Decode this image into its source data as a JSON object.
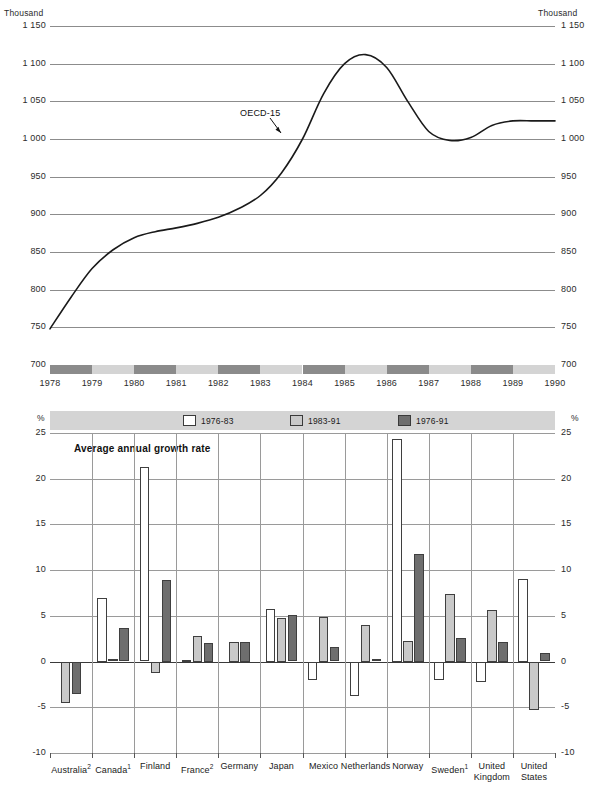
{
  "chart_data": [
    {
      "type": "line",
      "id": "oecd15-index",
      "title": "",
      "unit_label_left": "Thousand",
      "unit_label_right": "Thousand",
      "ylabel": "Thousand",
      "xlabel": "",
      "ylim": [
        700,
        1150
      ],
      "yticks": [
        "700",
        "750",
        "800",
        "850",
        "900",
        "950",
        "1 000",
        "1 050",
        "1 100",
        "1 150"
      ],
      "ytick_values": [
        700,
        750,
        800,
        850,
        900,
        950,
        1000,
        1050,
        1100,
        1150
      ],
      "xticks": [
        "1978",
        "1979",
        "1980",
        "1981",
        "1982",
        "1983",
        "1984",
        "1985",
        "1986",
        "1987",
        "1988",
        "1989",
        "1990"
      ],
      "grid": true,
      "legend": "none",
      "annotations": [
        {
          "text": "OECD-15",
          "x": 1983.3,
          "y": 1035
        }
      ],
      "series": [
        {
          "name": "OECD-15",
          "x": [
            1978,
            1978.5,
            1979,
            1979.5,
            1980,
            1980.5,
            1981,
            1981.5,
            1982,
            1982.5,
            1983,
            1983.5,
            1984,
            1984.5,
            1985,
            1985.5,
            1986,
            1986.5,
            1987,
            1987.5,
            1988,
            1988.5,
            1989,
            1989.5,
            1990
          ],
          "values": [
            748,
            790,
            828,
            853,
            869,
            877,
            882,
            888,
            896,
            908,
            925,
            955,
            1000,
            1060,
            1100,
            1112,
            1095,
            1050,
            1010,
            998,
            1002,
            1018,
            1024,
            1024,
            1024
          ]
        }
      ]
    },
    {
      "type": "bar",
      "id": "average-annual-growth-rate",
      "title": "Average annual growth rate",
      "unit_label_left": "%",
      "unit_label_right": "%",
      "ylabel": "%",
      "xlabel": "",
      "ylim": [
        -10,
        25
      ],
      "yticks": [
        "-10",
        "-5",
        "0",
        "5",
        "10",
        "15",
        "20",
        "25"
      ],
      "ytick_values": [
        -10,
        -5,
        0,
        5,
        10,
        15,
        20,
        25
      ],
      "grid": true,
      "legend_position": "top",
      "categories": [
        {
          "label": "Australia",
          "sup": "2"
        },
        {
          "label": "Canada",
          "sup": "1"
        },
        {
          "label": "Finland",
          "sup": ""
        },
        {
          "label": "France",
          "sup": "2"
        },
        {
          "label": "Germany",
          "sup": ""
        },
        {
          "label": "Japan",
          "sup": ""
        },
        {
          "label": "Mexico",
          "sup": ""
        },
        {
          "label": "Netherlands",
          "sup": ""
        },
        {
          "label": "Norway",
          "sup": ""
        },
        {
          "label": "Sweden",
          "sup": "1"
        },
        {
          "label": "United Kingdom",
          "sup": ""
        },
        {
          "label": "United States",
          "sup": ""
        }
      ],
      "series": [
        {
          "name": "1976-83",
          "color": "#ffffff",
          "values": [
            null,
            7.0,
            21.3,
            0.2,
            null,
            5.8,
            -2.0,
            -3.8,
            24.3,
            -2.0,
            -2.2,
            9.0
          ]
        },
        {
          "name": "1983-91",
          "color": "#c9c9c9",
          "values": [
            -4.5,
            0.3,
            -1.3,
            2.8,
            2.2,
            4.8,
            4.9,
            4.0,
            2.3,
            7.4,
            5.7,
            -5.3
          ]
        },
        {
          "name": "1976-91",
          "color": "#6e6e6e",
          "values": [
            -3.5,
            3.7,
            8.9,
            2.0,
            2.1,
            5.1,
            1.6,
            0.3,
            11.8,
            2.6,
            2.1,
            0.9
          ]
        }
      ]
    }
  ],
  "line_chart": {
    "unit_left": "Thousand",
    "unit_right": "Thousand",
    "annotation": "OECD-15",
    "y_labels": [
      "1 150",
      "1 100",
      "1 050",
      "1 000",
      "950",
      "900",
      "850",
      "800",
      "750",
      "700"
    ],
    "y_labels_right": [
      "1 150",
      "1 100",
      "1 050",
      "1 000",
      "950",
      "900",
      "850",
      "800",
      "750",
      "700"
    ],
    "x_labels": [
      "1978",
      "1979",
      "1980",
      "1981",
      "1982",
      "1983",
      "1984",
      "1985",
      "1986",
      "1987",
      "1988",
      "1989",
      "1990"
    ]
  },
  "bar_chart": {
    "unit_left": "%",
    "unit_right": "%",
    "title": "Average annual growth rate",
    "legend": [
      {
        "label": "1976-83",
        "swatch": "white"
      },
      {
        "label": "1983-91",
        "swatch": "light-gray"
      },
      {
        "label": "1976-91",
        "swatch": "dark-gray"
      }
    ],
    "y_labels": [
      "25",
      "20",
      "15",
      "10",
      "5",
      "0",
      "-5",
      "-10"
    ],
    "y_labels_right": [
      "25",
      "20",
      "15",
      "10",
      "5",
      "0",
      "-5",
      "-10"
    ],
    "country_labels": [
      "Australia",
      "Canada",
      "Finland",
      "France",
      "Germany",
      "Japan",
      "Mexico",
      "Netherlands",
      "Norway",
      "Sweden",
      "United Kingdom",
      "United States"
    ],
    "country_superscripts": [
      "2",
      "1",
      "",
      "2",
      "",
      "",
      "",
      "",
      "",
      "1",
      "",
      ""
    ]
  },
  "colors": {
    "series_1976_83": "#ffffff",
    "series_1983_91": "#c9c9c9",
    "series_1976_91": "#6e6e6e",
    "band_dark": "#8b8b8b",
    "band_light": "#d4d4d4",
    "grid": "#8c8c8c",
    "line": "#1a1a1a"
  }
}
